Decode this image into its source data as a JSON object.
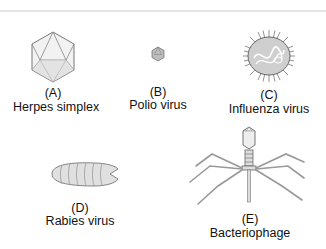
{
  "figure": {
    "viruses": [
      {
        "letter": "(A)",
        "name": "Herpes simplex",
        "shape": "icosahedron-large"
      },
      {
        "letter": "(B)",
        "name": "Polio virus",
        "shape": "icosahedron-small"
      },
      {
        "letter": "(C)",
        "name": "Influenza virus",
        "shape": "spiked-sphere"
      },
      {
        "letter": "(D)",
        "name": "Rabies virus",
        "shape": "bullet"
      },
      {
        "letter": "(E)",
        "name": "Bacteriophage",
        "shape": "head-tail-legs"
      }
    ]
  }
}
